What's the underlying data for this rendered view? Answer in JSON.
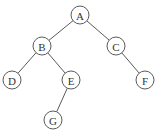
{
  "diagram": {
    "type": "binary-tree",
    "node_radius": 9,
    "colors": {
      "stroke": "#5a5a5a",
      "text": "#333333",
      "background": "#ffffff"
    },
    "nodes": [
      {
        "id": "A",
        "label": "A",
        "x": 80,
        "y": 15
      },
      {
        "id": "B",
        "label": "B",
        "x": 42,
        "y": 46
      },
      {
        "id": "C",
        "label": "C",
        "x": 116,
        "y": 46
      },
      {
        "id": "D",
        "label": "D",
        "x": 12,
        "y": 80
      },
      {
        "id": "E",
        "label": "E",
        "x": 71,
        "y": 80
      },
      {
        "id": "F",
        "label": "F",
        "x": 145,
        "y": 80
      },
      {
        "id": "G",
        "label": "G",
        "x": 53,
        "y": 120
      }
    ],
    "edges": [
      {
        "from": "A",
        "to": "B"
      },
      {
        "from": "A",
        "to": "C"
      },
      {
        "from": "B",
        "to": "D"
      },
      {
        "from": "B",
        "to": "E"
      },
      {
        "from": "C",
        "to": "F"
      },
      {
        "from": "E",
        "to": "G"
      }
    ]
  }
}
